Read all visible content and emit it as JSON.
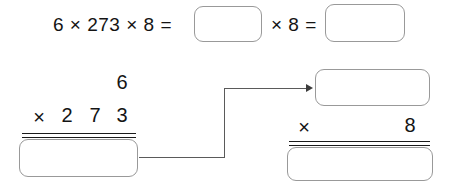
{
  "worksheet": {
    "title": "multiplication-step-worksheet",
    "colors": {
      "ink": "#141414",
      "box_border": "#999999",
      "rule": "#1b1b1b",
      "connector": "#5a5a5a",
      "background": "#ffffff"
    }
  },
  "equation_row": {
    "lead_expression": "6 × 273 × 8 =",
    "middle_operator": "× 8 =",
    "box1_value": "",
    "box2_value": ""
  },
  "left_problem": {
    "carry": "6",
    "operator": "×",
    "digits": [
      "2",
      "7",
      "3"
    ],
    "answer_value": ""
  },
  "right_problem": {
    "product_box_value": "",
    "operator": "×",
    "multiplier": "8",
    "answer_value": ""
  },
  "connector": {
    "label": "carry-result-arrow"
  }
}
